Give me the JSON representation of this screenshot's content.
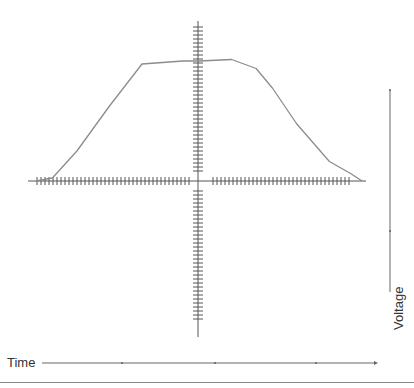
{
  "colors": {
    "axis": "#555555",
    "curve": "#8c8c8c",
    "arrow": "#666666"
  },
  "labels": {
    "time": "Time",
    "voltage": "Voltage"
  },
  "chart_data": {
    "type": "line",
    "title": "",
    "xlabel": "Time",
    "ylabel": "Voltage",
    "x": [
      -1.0,
      -0.9,
      -0.75,
      -0.55,
      -0.35,
      -0.1,
      0.0,
      0.2,
      0.35,
      0.45,
      0.6,
      0.8,
      0.93,
      1.0
    ],
    "y": [
      0.0,
      0.02,
      0.2,
      0.5,
      0.78,
      0.8,
      0.8,
      0.81,
      0.75,
      0.62,
      0.38,
      0.13,
      0.05,
      0.0
    ],
    "xlim": [
      -1.05,
      1.0
    ],
    "ylim": [
      -1.0,
      1.0
    ],
    "grid": false,
    "time_axis_markers": 3,
    "voltage_axis_markers": 2
  }
}
